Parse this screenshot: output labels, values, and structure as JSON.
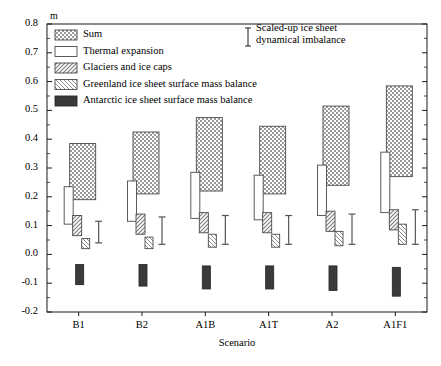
{
  "chart_data": {
    "type": "bar",
    "title": "",
    "xlabel": "Scenario",
    "ylabel": "m",
    "unit": "m",
    "ylim": [
      -0.2,
      0.8
    ],
    "ytick_labels": [
      "0.8",
      "0.7",
      "0.6",
      "0.5",
      "0.4",
      "0.3",
      "0.2",
      "0.1",
      "0.0",
      "-0.1",
      "-0.2"
    ],
    "ytick_values": [
      0.8,
      0.7,
      0.6,
      0.5,
      0.4,
      0.3,
      0.2,
      0.1,
      0.0,
      -0.1,
      -0.2
    ],
    "grid": false,
    "categories": [
      "B1",
      "B2",
      "A1B",
      "A1T",
      "A2",
      "A1F1"
    ],
    "legend_position": "top-left",
    "series": [
      {
        "name": "Sum",
        "pattern": "checker",
        "low": [
          0.19,
          0.21,
          0.22,
          0.21,
          0.24,
          0.27
        ],
        "high": [
          0.385,
          0.425,
          0.475,
          0.445,
          0.515,
          0.585
        ]
      },
      {
        "name": "Thermal expansion",
        "pattern": "white",
        "low": [
          0.105,
          0.115,
          0.125,
          0.12,
          0.135,
          0.145
        ],
        "high": [
          0.235,
          0.255,
          0.285,
          0.275,
          0.31,
          0.355
        ]
      },
      {
        "name": "Glaciers and ice caps",
        "pattern": "hatch-right",
        "low": [
          0.065,
          0.07,
          0.075,
          0.075,
          0.08,
          0.085
        ],
        "high": [
          0.135,
          0.14,
          0.145,
          0.145,
          0.15,
          0.155
        ]
      },
      {
        "name": "Greenland ice sheet surface mass balance",
        "pattern": "hatch-left",
        "low": [
          0.02,
          0.02,
          0.025,
          0.025,
          0.03,
          0.035
        ],
        "high": [
          0.055,
          0.06,
          0.07,
          0.07,
          0.08,
          0.105
        ]
      },
      {
        "name": "Antarctic ice sheet surface mass balance",
        "pattern": "solid-dark",
        "low": [
          -0.105,
          -0.11,
          -0.12,
          -0.12,
          -0.125,
          -0.145
        ],
        "high": [
          -0.035,
          -0.035,
          -0.04,
          -0.04,
          -0.04,
          -0.045
        ]
      }
    ],
    "error_bars": {
      "name": "Scaled-up ice sheet dynamical imbalance",
      "low": [
        0.04,
        0.035,
        0.035,
        0.035,
        0.035,
        0.035
      ],
      "high": [
        0.115,
        0.13,
        0.135,
        0.135,
        0.14,
        0.155
      ]
    }
  },
  "legend": {
    "items": [
      {
        "label": "Sum",
        "pattern": "checker"
      },
      {
        "label": "Thermal expansion",
        "pattern": "white"
      },
      {
        "label": "Glaciers and ice caps",
        "pattern": "hatch-right"
      },
      {
        "label": "Greenland ice sheet surface mass balance",
        "pattern": "hatch-left"
      },
      {
        "label": "Antarctic ice sheet surface mass balance",
        "pattern": "solid-dark"
      }
    ]
  },
  "annotation": {
    "line1": "Scaled-up ice sheet",
    "line2": "dynamical imbalance"
  },
  "colors": {
    "axis": "#1a1a1a",
    "sum_fill": "#b8b8b8",
    "dark_fill": "#3a3a3a",
    "hatch": "#8a8a8a",
    "background": "#ffffff"
  }
}
